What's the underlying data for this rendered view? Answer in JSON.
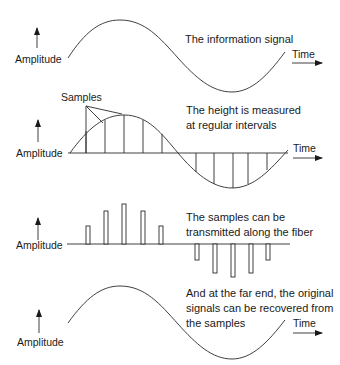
{
  "panels": [
    {
      "id": "information-signal",
      "caption": [
        "The information signal"
      ],
      "y_label": "Amplitude",
      "x_label": "Time"
    },
    {
      "id": "sampling",
      "caption": [
        "The height is measured",
        "at regular intervals"
      ],
      "y_label": "Amplitude",
      "x_label": "Time",
      "annotation": "Samples"
    },
    {
      "id": "transmitted-samples",
      "caption": [
        "The samples can be",
        "transmitted along the fiber"
      ],
      "y_label": "Amplitude"
    },
    {
      "id": "recovered-signal",
      "caption": [
        "And at the far end, the original",
        "signals can be recovered from",
        "the samples"
      ],
      "y_label": "Amplitude",
      "x_label": "Time"
    }
  ],
  "samples": {
    "count": 10,
    "relative_heights": [
      0.5,
      0.85,
      1.0,
      0.85,
      0.5,
      -0.5,
      -0.85,
      -1.0,
      -0.85,
      -0.5
    ]
  }
}
